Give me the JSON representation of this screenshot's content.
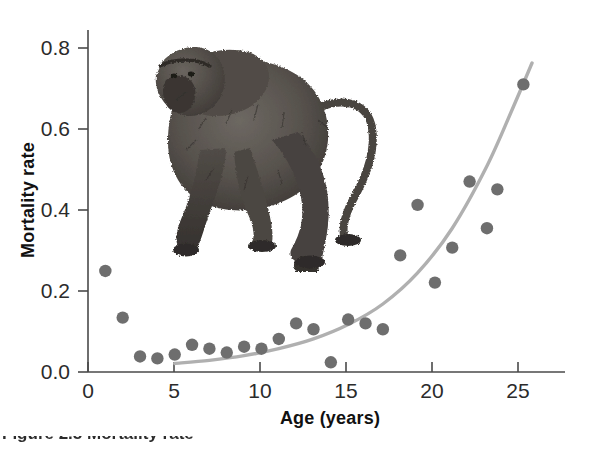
{
  "figure": {
    "caption_partial": "Figure 2.5  Mortality rate",
    "illustration_name": "baboon-illustration"
  },
  "chart_data": {
    "type": "scatter",
    "title": "",
    "xlabel": "Age (years)",
    "ylabel": "Mortality rate",
    "xlim": [
      0,
      27.5
    ],
    "ylim": [
      0,
      0.88
    ],
    "xticks": [
      0,
      5,
      10,
      15,
      20,
      25
    ],
    "xticklabels": [
      "0",
      "5",
      "10",
      "15",
      "20",
      "25"
    ],
    "yticks": [
      0.0,
      0.2,
      0.4,
      0.6,
      0.8
    ],
    "yticklabels": [
      "0.0",
      "0.2",
      "0.4",
      "0.6",
      "0.8"
    ],
    "grid": false,
    "legend": "none",
    "marker_color": "#6e6e6e",
    "curve_color": "#b0b0b0",
    "points": [
      {
        "x": 1,
        "y": 0.26
      },
      {
        "x": 2,
        "y": 0.14
      },
      {
        "x": 3,
        "y": 0.04
      },
      {
        "x": 4,
        "y": 0.035
      },
      {
        "x": 5,
        "y": 0.045
      },
      {
        "x": 6,
        "y": 0.07
      },
      {
        "x": 7,
        "y": 0.06
      },
      {
        "x": 8,
        "y": 0.05
      },
      {
        "x": 9,
        "y": 0.065
      },
      {
        "x": 10,
        "y": 0.06
      },
      {
        "x": 11,
        "y": 0.085
      },
      {
        "x": 12,
        "y": 0.125
      },
      {
        "x": 13,
        "y": 0.11
      },
      {
        "x": 14,
        "y": 0.025
      },
      {
        "x": 15,
        "y": 0.135
      },
      {
        "x": 16,
        "y": 0.125
      },
      {
        "x": 17,
        "y": 0.11
      },
      {
        "x": 18,
        "y": 0.3
      },
      {
        "x": 19,
        "y": 0.43
      },
      {
        "x": 20,
        "y": 0.23
      },
      {
        "x": 21,
        "y": 0.32
      },
      {
        "x": 22,
        "y": 0.49
      },
      {
        "x": 23,
        "y": 0.37
      },
      {
        "x": 23.6,
        "y": 0.47
      },
      {
        "x": 25.1,
        "y": 0.74
      }
    ],
    "curve": {
      "description": "exponential mortality fit",
      "points": [
        {
          "x": 5.0,
          "y": 0.022
        },
        {
          "x": 7.0,
          "y": 0.03
        },
        {
          "x": 9.0,
          "y": 0.042
        },
        {
          "x": 11.0,
          "y": 0.06
        },
        {
          "x": 13.0,
          "y": 0.085
        },
        {
          "x": 15.0,
          "y": 0.122
        },
        {
          "x": 17.0,
          "y": 0.175
        },
        {
          "x": 19.0,
          "y": 0.255
        },
        {
          "x": 21.0,
          "y": 0.37
        },
        {
          "x": 23.0,
          "y": 0.53
        },
        {
          "x": 24.5,
          "y": 0.68
        },
        {
          "x": 25.6,
          "y": 0.795
        }
      ]
    }
  }
}
